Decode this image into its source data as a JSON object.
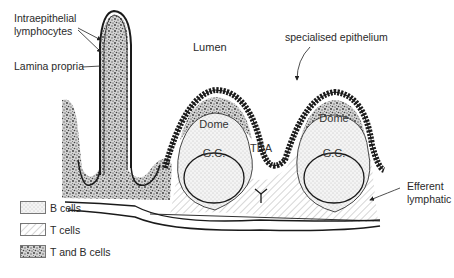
{
  "labels": {
    "intraepithelial": "Intraepithelial",
    "lymphocytes": "lymphocytes",
    "lamina_propria": "Lamina propria",
    "lumen": "Lumen",
    "specialised_epithelium": "specialised epithelium",
    "dome_1": "Dome",
    "dome_2": "Dome",
    "gc_1": "G.C.",
    "gc_2": "G.C.",
    "tda": "TDA",
    "efferent": "Efferent",
    "lymphatic": "lymphatic"
  },
  "legend": {
    "items": [
      {
        "label": "B cells",
        "pattern": "stipple-light"
      },
      {
        "label": "T cells",
        "pattern": "diagonal-hatch"
      },
      {
        "label": "T and B cells",
        "pattern": "dense-speckle"
      }
    ]
  },
  "colors": {
    "ink": "#1a1a1a",
    "background": "#ffffff"
  }
}
